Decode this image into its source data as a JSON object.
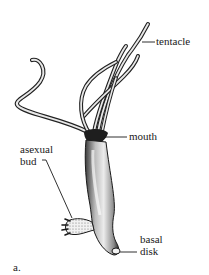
{
  "figure": {
    "caption": "a.",
    "labels": {
      "tentacle": "tentacle",
      "mouth": "mouth",
      "asexual_bud_line1": "asexual",
      "asexual_bud_line2": "bud",
      "basal_disk_line1": "basal",
      "basal_disk_line2": "disk"
    }
  },
  "colors": {
    "background": "#ffffff",
    "ink": "#1a1a1a",
    "body_fill": "#d8d8d8"
  }
}
